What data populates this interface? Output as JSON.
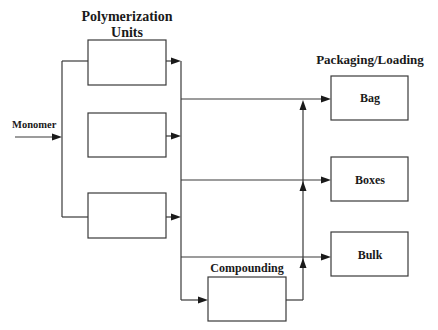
{
  "diagram": {
    "type": "process-flow",
    "titles": {
      "polymerization_line1": "Polymerization",
      "polymerization_line2": "Units",
      "packaging": "Packaging/Loading"
    },
    "input": {
      "label": "Monomer"
    },
    "polymerization_units": [
      {
        "id": "unit-1",
        "label": ""
      },
      {
        "id": "unit-2",
        "label": ""
      },
      {
        "id": "unit-3",
        "label": ""
      }
    ],
    "compounding": {
      "label": "Compounding"
    },
    "packaging_boxes": [
      {
        "id": "bag",
        "label": "Bag"
      },
      {
        "id": "boxes",
        "label": "Boxes"
      },
      {
        "id": "bulk",
        "label": "Bulk"
      }
    ],
    "edges": [
      {
        "from": "Monomer",
        "to": "Polymerization Units"
      },
      {
        "from": "Polymerization Units",
        "to": "Bag"
      },
      {
        "from": "Polymerization Units",
        "to": "Boxes"
      },
      {
        "from": "Polymerization Units",
        "to": "Bulk"
      },
      {
        "from": "Polymerization Units",
        "to": "Compounding"
      },
      {
        "from": "Compounding",
        "to": "Bag"
      },
      {
        "from": "Compounding",
        "to": "Boxes"
      },
      {
        "from": "Compounding",
        "to": "Bulk"
      }
    ],
    "colors": {
      "line": "#3a3a3a",
      "text": "#1a1a1a",
      "background": "#ffffff"
    }
  }
}
